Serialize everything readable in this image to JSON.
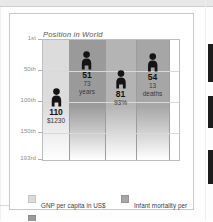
{
  "figure": {
    "title": "Position in World"
  },
  "chart_data": {
    "type": "bar",
    "title": "Position in World",
    "xlabel": "",
    "ylabel": "Position in World",
    "ylim": [
      1,
      193
    ],
    "y_ticks": [
      "1st",
      "50th",
      "100th",
      "150th",
      "193rd"
    ],
    "y_tick_values": [
      1,
      50,
      100,
      150,
      193
    ],
    "grid": true,
    "legend_position": "bottom",
    "categories": [
      "GNP per capita in US$",
      "Life expectancy",
      "Literacy",
      "Infant mortality per 1000 live births"
    ],
    "values": [
      110,
      51,
      81,
      54
    ],
    "points": [
      {
        "category": "GNP per capita in US$",
        "rank": "110",
        "rank_value": 110,
        "value_label": "$1230",
        "unit": "",
        "band_color": "#dcdcdc"
      },
      {
        "category": "Life expectancy",
        "rank": "51",
        "rank_value": 51,
        "value_label": "73",
        "unit": "years",
        "band_color": "#9a9a9a"
      },
      {
        "category": "Literacy",
        "rank": "81",
        "rank_value": 81,
        "value_label": "93%",
        "unit": "",
        "band_color": "#b4b4b4"
      },
      {
        "category": "Infant mortality per 1000 live births",
        "rank": "54",
        "rank_value": 54,
        "value_label": "13",
        "unit": "deaths",
        "band_color": "#a6a6a6"
      }
    ],
    "annotations": [
      "110 / $1230",
      "51 / 73 years",
      "81 / 93%",
      "54 / 13 deaths"
    ]
  },
  "legend": {
    "column_left": [
      {
        "label": "GNP per capita in US$",
        "color": "#dcdcdc"
      },
      {
        "label": "Life expectancy",
        "color": "#9a9a9a"
      },
      {
        "label": "Literacy",
        "color": "#b4b4b4"
      }
    ],
    "column_right": [
      {
        "label": "Infant mortality per",
        "label2": "1000 live births",
        "color": "#a6a6a6"
      },
      {
        "label": "Human dev. index",
        "label2": "",
        "color": "#8e8e8e"
      }
    ]
  }
}
